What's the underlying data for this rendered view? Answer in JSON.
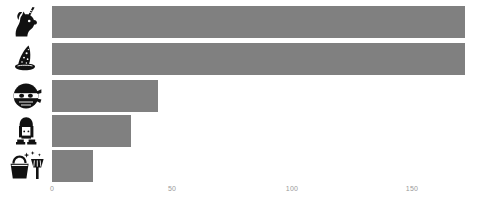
{
  "chart_data": {
    "type": "bar",
    "orientation": "horizontal",
    "title": "",
    "subtitle": "",
    "xlabel": "",
    "ylabel": "",
    "categories": [
      "unicorn",
      "wizard-hat",
      "ninja",
      "person",
      "bucket-and-broom"
    ],
    "category_label_type": "icon",
    "values": [
      172,
      172,
      44,
      33,
      17
    ],
    "series": [
      {
        "name": "",
        "values": [
          172,
          172,
          44,
          33,
          17
        ]
      }
    ],
    "xlim": [
      0,
      177
    ],
    "ylim": null,
    "xticks": [
      0,
      50,
      100,
      150
    ],
    "xtick_labels": [
      "0",
      "50",
      "100",
      "150"
    ],
    "yticks": [],
    "ytick_labels": [],
    "grid": false,
    "legend": false,
    "legend_position": "none",
    "annotations": [],
    "bar_color": "#808080",
    "background_color": "#ffffff",
    "tick_label_color": "#9a9a9a",
    "icon_color": "#111111"
  },
  "axis": {
    "ticks": [
      {
        "label": "0",
        "value": 0
      },
      {
        "label": "50",
        "value": 50
      },
      {
        "label": "100",
        "value": 100
      },
      {
        "label": "150",
        "value": 150
      }
    ]
  },
  "rows": [
    {
      "icon": "unicorn-icon",
      "icon_label": "unicorn",
      "value": 172
    },
    {
      "icon": "wizard-hat-icon",
      "icon_label": "wizard hat",
      "value": 172
    },
    {
      "icon": "ninja-icon",
      "icon_label": "ninja",
      "value": 44
    },
    {
      "icon": "person-icon",
      "icon_label": "person",
      "value": 33
    },
    {
      "icon": "bucket-and-broom-icon",
      "icon_label": "bucket and broom",
      "value": 17
    }
  ]
}
